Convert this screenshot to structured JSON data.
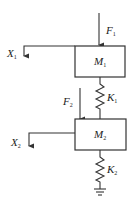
{
  "diagram": {
    "type": "two-mass spring system",
    "masses": [
      {
        "id": "M1",
        "label": "M",
        "sub": "1"
      },
      {
        "id": "M2",
        "label": "M",
        "sub": "2"
      }
    ],
    "springs": [
      {
        "id": "K1",
        "label": "K",
        "sub": "1",
        "connects": [
          "M1",
          "M2"
        ]
      },
      {
        "id": "K2",
        "label": "K",
        "sub": "2",
        "connects": [
          "M2",
          "ground"
        ]
      }
    ],
    "forces": [
      {
        "id": "F1",
        "label": "F",
        "sub": "1",
        "acts_on": "M1",
        "direction": "down"
      },
      {
        "id": "F2",
        "label": "F",
        "sub": "2",
        "acts_on": "M2",
        "direction": "down"
      }
    ],
    "displacements": [
      {
        "id": "X1",
        "label": "X",
        "sub": "1",
        "of": "M1",
        "direction": "down"
      },
      {
        "id": "X2",
        "label": "X",
        "sub": "2",
        "of": "M2",
        "direction": "down"
      }
    ],
    "ground": {
      "label": "ground"
    }
  }
}
